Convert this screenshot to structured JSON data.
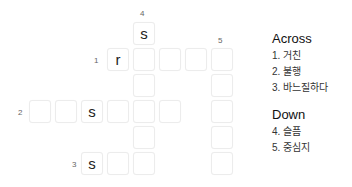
{
  "grid": {
    "cells": [
      {
        "row": 0,
        "col": 4,
        "letter": "s"
      },
      {
        "row": 1,
        "col": 3,
        "letter": "r"
      },
      {
        "row": 1,
        "col": 4,
        "letter": ""
      },
      {
        "row": 1,
        "col": 5,
        "letter": ""
      },
      {
        "row": 1,
        "col": 6,
        "letter": ""
      },
      {
        "row": 1,
        "col": 7,
        "letter": ""
      },
      {
        "row": 2,
        "col": 4,
        "letter": ""
      },
      {
        "row": 2,
        "col": 7,
        "letter": ""
      },
      {
        "row": 3,
        "col": 0,
        "letter": ""
      },
      {
        "row": 3,
        "col": 1,
        "letter": ""
      },
      {
        "row": 3,
        "col": 2,
        "letter": "s"
      },
      {
        "row": 3,
        "col": 3,
        "letter": ""
      },
      {
        "row": 3,
        "col": 4,
        "letter": ""
      },
      {
        "row": 3,
        "col": 5,
        "letter": ""
      },
      {
        "row": 3,
        "col": 7,
        "letter": ""
      },
      {
        "row": 4,
        "col": 4,
        "letter": ""
      },
      {
        "row": 4,
        "col": 7,
        "letter": ""
      },
      {
        "row": 5,
        "col": 2,
        "letter": "s"
      },
      {
        "row": 5,
        "col": 3,
        "letter": ""
      },
      {
        "row": 5,
        "col": 4,
        "letter": ""
      },
      {
        "row": 5,
        "col": 7,
        "letter": ""
      }
    ],
    "numbers": [
      {
        "n": "4",
        "x": 140,
        "y": 9
      },
      {
        "n": "5",
        "x": 218,
        "y": 36
      },
      {
        "n": "1",
        "x": 94,
        "y": 56
      },
      {
        "n": "2",
        "x": 18,
        "y": 108
      },
      {
        "n": "3",
        "x": 72,
        "y": 160
      }
    ]
  },
  "clues": {
    "across_title": "Across",
    "across": [
      "1. 거친",
      "2. 불행",
      "3. 바느질하다"
    ],
    "down_title": "Down",
    "down": [
      "4. 슬픔",
      "5. 중심지"
    ]
  }
}
